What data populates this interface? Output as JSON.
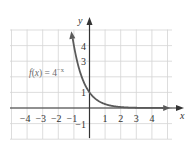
{
  "chart_data": {
    "type": "line",
    "title": "",
    "function_label": "f(x) = 4^{-x}",
    "function_label_display": "f(x) = 4",
    "function_label_exponent": "−x",
    "xlabel": "x",
    "ylabel": "y",
    "xlim": [
      -5,
      5
    ],
    "ylim": [
      -2,
      5
    ],
    "xticks": [
      -4,
      -3,
      -2,
      -1,
      1,
      2,
      3,
      4
    ],
    "xtick_labels": [
      "−4",
      "−3",
      "−2",
      "−1",
      "1",
      "2",
      "3",
      "4"
    ],
    "yticks": [
      -1,
      1,
      3,
      4
    ],
    "ytick_labels": [
      "−1",
      "1",
      "3",
      "4"
    ],
    "grid": true,
    "series": [
      {
        "name": "f(x) = 4^-x",
        "x": [
          -1.1,
          -1,
          -0.75,
          -0.5,
          -0.25,
          0,
          0.25,
          0.5,
          1,
          1.5,
          2,
          3,
          4,
          4.8
        ],
        "y": [
          4.59,
          4,
          2.83,
          2,
          1.41,
          1,
          0.71,
          0.5,
          0.25,
          0.125,
          0.0625,
          0.0156,
          0.0039,
          0.0013
        ]
      }
    ],
    "colors": {
      "curve": "#5a5a5a",
      "axis": "#333333",
      "grid": "#d4d4d4"
    }
  }
}
